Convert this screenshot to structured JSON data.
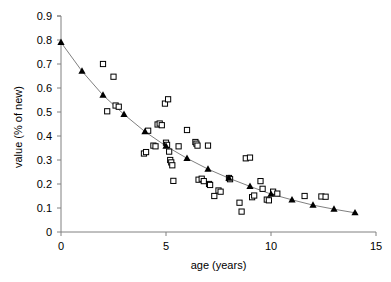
{
  "chart_data": {
    "type": "scatter",
    "title": "",
    "xlabel": "age (years)",
    "ylabel": "value (% of new)",
    "xlim": [
      0,
      15
    ],
    "ylim": [
      0,
      0.9
    ],
    "xticks": [
      0,
      5,
      10,
      15
    ],
    "xtick_labels": [
      "0",
      "5",
      "10",
      "15"
    ],
    "yticks": [
      0,
      0.1,
      0.2,
      0.3,
      0.4,
      0.5,
      0.6,
      0.7,
      0.8,
      0.9
    ],
    "ytick_labels": [
      "0",
      "0.1",
      "0.2",
      "0.3",
      "0.4",
      "0.5",
      "0.6",
      "0.7",
      "0.8",
      "0.9"
    ],
    "grid": false,
    "legend": "none",
    "series": [
      {
        "name": "observed data",
        "marker": "open-square",
        "marker_color": "#000000",
        "marker_fill": "#ffffff",
        "points": [
          [
            2.0,
            0.7
          ],
          [
            2.2,
            0.503
          ],
          [
            2.5,
            0.647
          ],
          [
            2.6,
            0.527
          ],
          [
            2.75,
            0.522
          ],
          [
            3.95,
            0.327
          ],
          [
            4.05,
            0.333
          ],
          [
            4.15,
            0.422
          ],
          [
            4.4,
            0.36
          ],
          [
            4.5,
            0.357
          ],
          [
            4.6,
            0.448
          ],
          [
            4.7,
            0.452
          ],
          [
            4.8,
            0.445
          ],
          [
            4.95,
            0.535
          ],
          [
            5.1,
            0.553
          ],
          [
            5.0,
            0.372
          ],
          [
            5.05,
            0.363
          ],
          [
            5.15,
            0.335
          ],
          [
            5.2,
            0.3
          ],
          [
            5.25,
            0.29
          ],
          [
            5.3,
            0.278
          ],
          [
            5.35,
            0.213
          ],
          [
            5.6,
            0.357
          ],
          [
            6.0,
            0.425
          ],
          [
            6.4,
            0.375
          ],
          [
            6.45,
            0.368
          ],
          [
            6.5,
            0.36
          ],
          [
            6.55,
            0.218
          ],
          [
            6.7,
            0.222
          ],
          [
            6.8,
            0.212
          ],
          [
            7.0,
            0.36
          ],
          [
            7.05,
            0.2
          ],
          [
            7.1,
            0.196
          ],
          [
            7.3,
            0.15
          ],
          [
            7.5,
            0.173
          ],
          [
            7.6,
            0.168
          ],
          [
            8.0,
            0.225
          ],
          [
            8.05,
            0.22
          ],
          [
            8.5,
            0.122
          ],
          [
            8.6,
            0.085
          ],
          [
            8.8,
            0.307
          ],
          [
            9.0,
            0.31
          ],
          [
            9.1,
            0.145
          ],
          [
            9.2,
            0.152
          ],
          [
            9.5,
            0.212
          ],
          [
            9.6,
            0.18
          ],
          [
            9.8,
            0.135
          ],
          [
            9.9,
            0.132
          ],
          [
            10.1,
            0.168
          ],
          [
            10.3,
            0.16
          ],
          [
            11.6,
            0.15
          ],
          [
            12.4,
            0.148
          ],
          [
            12.6,
            0.147
          ]
        ]
      },
      {
        "name": "fitted curve",
        "marker": "filled-triangle",
        "marker_color": "#000000",
        "line": true,
        "line_color": "#808080",
        "points": [
          [
            0,
            0.79
          ],
          [
            1,
            0.67
          ],
          [
            2,
            0.57
          ],
          [
            3,
            0.49
          ],
          [
            4,
            0.418
          ],
          [
            5,
            0.358
          ],
          [
            6,
            0.307
          ],
          [
            7,
            0.262
          ],
          [
            8,
            0.224
          ],
          [
            9,
            0.19
          ],
          [
            10,
            0.158
          ],
          [
            11,
            0.134
          ],
          [
            12,
            0.112
          ],
          [
            13,
            0.095
          ],
          [
            14,
            0.08
          ]
        ]
      }
    ]
  },
  "axes": {
    "axis_color": "#808080",
    "plot_left_px": 61,
    "plot_right_px": 376,
    "plot_top_px": 16,
    "plot_bottom_px": 232
  }
}
